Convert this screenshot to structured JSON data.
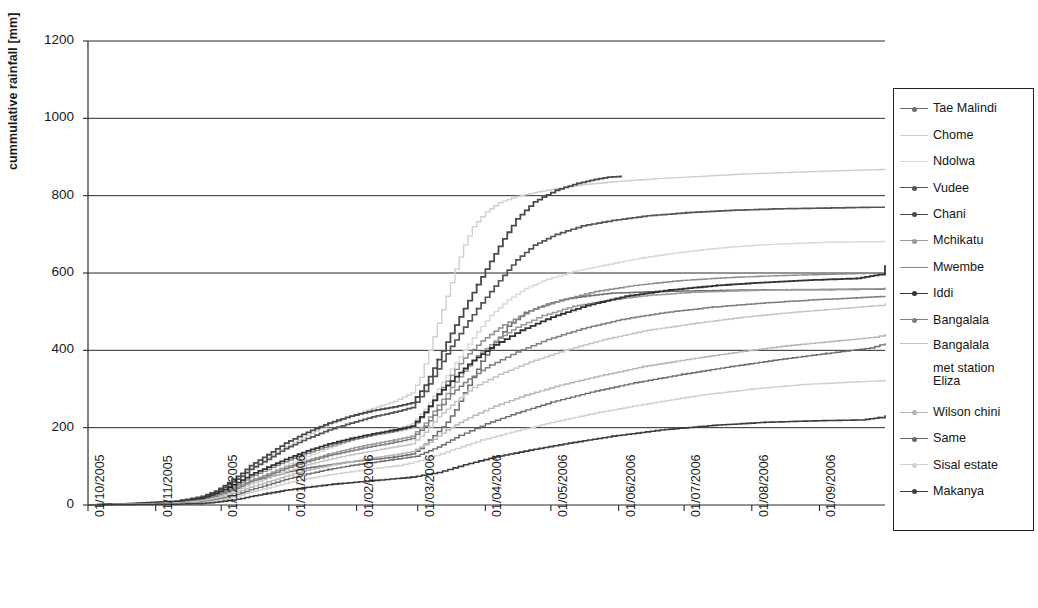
{
  "chart_data": {
    "type": "line",
    "title": "",
    "xlabel": "",
    "ylabel": "cummulative rainfall [mm]",
    "ylim": [
      0,
      1200
    ],
    "ytick_step": 200,
    "yticks": [
      "1200",
      "1000",
      "800",
      "600",
      "400",
      "200",
      "0"
    ],
    "grid": "horizontal",
    "legend_position": "right",
    "xticks": [
      "01/10/2005",
      "01/11/2005",
      "01/12/2005",
      "01/01/2006",
      "01/02/2006",
      "01/03/2006",
      "01/04/2006",
      "01/05/2006",
      "01/06/2006",
      "01/07/2006",
      "01/08/2006",
      "01/09/2006"
    ],
    "x_start": "01/10/2005",
    "x_end": "30/09/2006",
    "series": [
      {
        "name": "Tae Malindi",
        "color": "#6d6d6d",
        "width": 1.5,
        "marker": true,
        "final_value": 558,
        "x": [
          0,
          20,
          40,
          52,
          58,
          62,
          66,
          70,
          74,
          82,
          90,
          100,
          110,
          120,
          130,
          140,
          148,
          152,
          156,
          160,
          164,
          168,
          172,
          176,
          180,
          186,
          192,
          200,
          210,
          220,
          230,
          240,
          250,
          260,
          270,
          280,
          290,
          300,
          320,
          340,
          360,
          365
        ],
        "y": [
          0,
          2,
          6,
          14,
          26,
          34,
          44,
          52,
          62,
          72,
          84,
          96,
          104,
          112,
          118,
          124,
          132,
          146,
          168,
          190,
          214,
          246,
          290,
          330,
          372,
          420,
          462,
          498,
          520,
          534,
          542,
          548,
          550,
          552,
          553,
          554,
          555,
          556,
          557,
          557,
          558,
          558
        ]
      },
      {
        "name": "Chome",
        "color": "#cfcfcf",
        "width": 1.4,
        "marker": false,
        "final_value": 868,
        "x": [
          0,
          20,
          40,
          52,
          58,
          62,
          66,
          70,
          74,
          82,
          90,
          100,
          110,
          120,
          130,
          140,
          148,
          152,
          156,
          160,
          164,
          168,
          172,
          176,
          182,
          188,
          196,
          206,
          216,
          226,
          240,
          260,
          280,
          300,
          320,
          340,
          360,
          365
        ],
        "y": [
          0,
          3,
          8,
          18,
          30,
          42,
          58,
          76,
          96,
          122,
          150,
          180,
          208,
          230,
          250,
          268,
          290,
          330,
          400,
          470,
          540,
          610,
          672,
          720,
          758,
          782,
          798,
          810,
          820,
          828,
          836,
          844,
          850,
          856,
          860,
          864,
          867,
          868
        ]
      },
      {
        "name": "Ndolwa",
        "color": "#d8d8d8",
        "width": 1.4,
        "marker": false,
        "final_value": 682,
        "x": [
          0,
          20,
          40,
          52,
          58,
          62,
          66,
          70,
          74,
          82,
          90,
          100,
          110,
          120,
          130,
          140,
          148,
          154,
          160,
          166,
          172,
          178,
          184,
          192,
          200,
          210,
          222,
          236,
          250,
          266,
          284,
          300,
          320,
          340,
          360,
          365
        ],
        "y": [
          0,
          2,
          5,
          12,
          22,
          30,
          40,
          50,
          62,
          80,
          102,
          126,
          148,
          166,
          182,
          196,
          210,
          248,
          300,
          352,
          400,
          448,
          490,
          530,
          560,
          584,
          604,
          620,
          636,
          650,
          662,
          670,
          676,
          680,
          681,
          682
        ]
      },
      {
        "name": "Vudee",
        "color": "#555555",
        "width": 1.7,
        "marker": true,
        "final_value": 770,
        "x": [
          0,
          20,
          40,
          52,
          58,
          62,
          66,
          70,
          74,
          82,
          90,
          100,
          110,
          120,
          130,
          140,
          148,
          154,
          160,
          166,
          172,
          178,
          184,
          190,
          196,
          204,
          214,
          226,
          240,
          256,
          274,
          294,
          316,
          338,
          358,
          365
        ],
        "y": [
          0,
          3,
          9,
          20,
          34,
          46,
          60,
          74,
          92,
          118,
          146,
          172,
          194,
          212,
          228,
          240,
          252,
          294,
          352,
          410,
          460,
          508,
          552,
          594,
          634,
          672,
          700,
          722,
          736,
          748,
          756,
          762,
          766,
          768,
          770,
          770
        ]
      },
      {
        "name": "Chani",
        "color": "#4a4a4a",
        "width": 1.8,
        "marker": true,
        "final_value": 850,
        "x": [
          0,
          20,
          40,
          52,
          58,
          62,
          66,
          70,
          74,
          82,
          90,
          100,
          110,
          120,
          130,
          140,
          148,
          154,
          160,
          166,
          172,
          178,
          184,
          190,
          196,
          204,
          214,
          224,
          232,
          238,
          244
        ],
        "y": [
          0,
          4,
          10,
          22,
          36,
          50,
          66,
          82,
          102,
          130,
          160,
          188,
          212,
          230,
          244,
          254,
          264,
          310,
          376,
          444,
          508,
          570,
          630,
          688,
          740,
          784,
          814,
          832,
          842,
          848,
          850
        ]
      },
      {
        "name": "Mchikatu",
        "color": "#9a9a9a",
        "width": 1.5,
        "marker": true,
        "final_value": 560,
        "x": [
          0,
          20,
          40,
          52,
          58,
          62,
          66,
          70,
          74,
          82,
          90,
          100,
          110,
          120,
          130,
          140,
          148,
          154,
          160,
          166,
          172,
          178,
          186,
          196,
          208,
          222,
          238,
          256,
          276,
          298,
          320,
          342,
          360,
          365
        ],
        "y": [
          0,
          2,
          6,
          14,
          24,
          32,
          42,
          52,
          64,
          80,
          98,
          116,
          132,
          146,
          158,
          168,
          178,
          212,
          258,
          304,
          346,
          386,
          424,
          460,
          490,
          514,
          530,
          542,
          550,
          554,
          557,
          558,
          559,
          560
        ]
      },
      {
        "name": "Mwembe",
        "color": "#8b8b8b",
        "width": 1.4,
        "marker": false,
        "final_value": 600,
        "x": [
          0,
          20,
          40,
          52,
          58,
          62,
          66,
          70,
          74,
          82,
          90,
          100,
          110,
          120,
          130,
          140,
          148,
          154,
          160,
          166,
          172,
          180,
          190,
          202,
          216,
          232,
          250,
          270,
          292,
          314,
          336,
          356,
          365
        ],
        "y": [
          0,
          2,
          7,
          16,
          27,
          36,
          47,
          58,
          72,
          92,
          112,
          134,
          152,
          168,
          180,
          190,
          200,
          238,
          288,
          336,
          380,
          424,
          466,
          502,
          530,
          552,
          568,
          580,
          588,
          593,
          596,
          599,
          600
        ]
      },
      {
        "name": "Iddi",
        "color": "#333333",
        "width": 1.8,
        "marker": true,
        "final_value": 620,
        "x": [
          0,
          20,
          40,
          52,
          58,
          62,
          66,
          70,
          74,
          82,
          90,
          100,
          110,
          120,
          130,
          140,
          148,
          154,
          160,
          168,
          176,
          186,
          198,
          212,
          228,
          246,
          266,
          288,
          310,
          332,
          352,
          362,
          365
        ],
        "y": [
          0,
          3,
          8,
          18,
          30,
          40,
          52,
          64,
          78,
          98,
          118,
          140,
          158,
          172,
          184,
          194,
          204,
          240,
          286,
          332,
          374,
          414,
          452,
          486,
          516,
          540,
          556,
          568,
          576,
          582,
          586,
          596,
          620
        ]
      },
      {
        "name": "Bangalala",
        "color": "#7f7f7f",
        "width": 1.5,
        "marker": true,
        "final_value": 540,
        "x": [
          0,
          20,
          40,
          52,
          58,
          62,
          66,
          70,
          74,
          82,
          90,
          100,
          110,
          120,
          130,
          140,
          148,
          154,
          160,
          166,
          174,
          184,
          196,
          210,
          226,
          244,
          264,
          286,
          308,
          330,
          352,
          365
        ],
        "y": [
          0,
          2,
          6,
          13,
          22,
          30,
          39,
          48,
          60,
          76,
          94,
          112,
          128,
          140,
          152,
          162,
          172,
          204,
          246,
          288,
          326,
          362,
          396,
          428,
          456,
          480,
          498,
          512,
          522,
          530,
          536,
          540
        ]
      },
      {
        "name": "Bangalala met station Eliza",
        "color": "#c4c4c4",
        "width": 1.4,
        "marker": false,
        "final_value": 522,
        "x": [
          0,
          20,
          40,
          52,
          58,
          62,
          66,
          70,
          74,
          82,
          90,
          100,
          110,
          120,
          130,
          140,
          148,
          154,
          160,
          168,
          176,
          188,
          202,
          218,
          236,
          256,
          278,
          300,
          322,
          344,
          362,
          365
        ],
        "y": [
          0,
          2,
          5,
          11,
          19,
          26,
          34,
          43,
          54,
          70,
          86,
          104,
          118,
          130,
          140,
          150,
          158,
          188,
          228,
          268,
          304,
          338,
          370,
          400,
          428,
          452,
          470,
          486,
          498,
          508,
          516,
          522
        ]
      },
      {
        "name": "Wilson chini",
        "color": "#b5b5b5",
        "width": 1.4,
        "marker": true,
        "final_value": 440,
        "x": [
          0,
          20,
          40,
          52,
          58,
          62,
          66,
          70,
          74,
          82,
          90,
          100,
          110,
          120,
          130,
          140,
          148,
          156,
          164,
          174,
          186,
          200,
          216,
          234,
          254,
          276,
          298,
          320,
          342,
          360,
          365
        ],
        "y": [
          0,
          2,
          4,
          9,
          16,
          22,
          29,
          37,
          46,
          60,
          74,
          90,
          102,
          112,
          122,
          130,
          138,
          162,
          194,
          226,
          256,
          284,
          310,
          334,
          358,
          378,
          396,
          412,
          424,
          434,
          440
        ]
      },
      {
        "name": "Same",
        "color": "#6a6a6a",
        "width": 1.4,
        "marker": true,
        "final_value": 418,
        "x": [
          0,
          20,
          40,
          52,
          58,
          62,
          66,
          70,
          74,
          82,
          90,
          100,
          110,
          120,
          130,
          140,
          150,
          160,
          170,
          182,
          196,
          212,
          230,
          250,
          272,
          294,
          316,
          338,
          358,
          365
        ],
        "y": [
          0,
          1,
          3,
          7,
          13,
          18,
          24,
          31,
          39,
          52,
          66,
          80,
          92,
          102,
          110,
          118,
          126,
          150,
          180,
          210,
          238,
          266,
          292,
          316,
          338,
          358,
          376,
          392,
          406,
          418
        ]
      },
      {
        "name": "Sisal estate",
        "color": "#d0d0d0",
        "width": 1.4,
        "marker": true,
        "final_value": 322,
        "x": [
          0,
          20,
          40,
          52,
          58,
          62,
          66,
          70,
          74,
          82,
          90,
          100,
          110,
          120,
          130,
          142,
          154,
          166,
          180,
          196,
          214,
          234,
          256,
          280,
          304,
          328,
          350,
          365
        ],
        "y": [
          0,
          1,
          3,
          6,
          11,
          15,
          20,
          26,
          33,
          44,
          56,
          68,
          78,
          86,
          94,
          102,
          118,
          142,
          168,
          192,
          216,
          240,
          262,
          284,
          300,
          312,
          318,
          322
        ]
      },
      {
        "name": "Makanya",
        "color": "#3d3d3d",
        "width": 1.6,
        "marker": true,
        "final_value": 232,
        "x": [
          0,
          20,
          40,
          52,
          58,
          62,
          66,
          70,
          74,
          82,
          90,
          100,
          112,
          124,
          136,
          148,
          160,
          172,
          186,
          202,
          220,
          240,
          262,
          286,
          310,
          334,
          354,
          362,
          365
        ],
        "y": [
          0,
          1,
          2,
          4,
          7,
          10,
          13,
          17,
          22,
          30,
          38,
          46,
          54,
          60,
          66,
          72,
          84,
          104,
          124,
          142,
          160,
          178,
          194,
          206,
          214,
          218,
          220,
          226,
          232
        ]
      }
    ]
  },
  "axis": {
    "y_title": "cummulative rainfall [mm]"
  }
}
